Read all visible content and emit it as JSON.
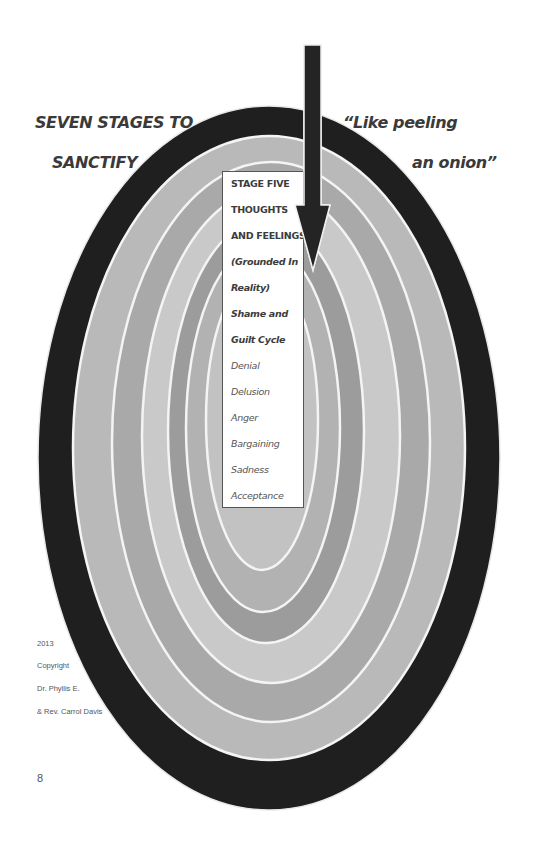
{
  "title": {
    "line1": "SEVEN STAGES TO",
    "line2": "SANCTIFY"
  },
  "quote": {
    "line1": "“Like peeling",
    "line2": "an onion”"
  },
  "stage_box": {
    "lines": [
      {
        "text": "STAGE FIVE",
        "style": "bold"
      },
      {
        "text": "THOUGHTS",
        "style": "bold"
      },
      {
        "text": "AND FEELINGS",
        "style": "bold"
      },
      {
        "text": "(Grounded In",
        "style": "bold-italic"
      },
      {
        "text": "Reality)",
        "style": "bold-italic"
      },
      {
        "text": "Shame and",
        "style": "bold-italic"
      },
      {
        "text": "Guilt Cycle",
        "style": "bold-italic"
      },
      {
        "text": "Denial",
        "style": "italic"
      },
      {
        "text": "Delusion",
        "style": "italic"
      },
      {
        "text": "Anger",
        "style": "italic"
      },
      {
        "text": "Bargaining",
        "style": "italic"
      },
      {
        "text": "Sadness",
        "style": "italic"
      },
      {
        "text": "Acceptance",
        "style": "italic"
      }
    ]
  },
  "copyright": {
    "year": "2013",
    "label": "Copyright",
    "author1": "Dr. Phyllis E.",
    "author2": "& Rev. Carrol Davis"
  },
  "page_number": "8",
  "diagram": {
    "type": "concentric-onion-rings",
    "ring_count": 7,
    "ring_colors": [
      "#1f1f1f",
      "#b9b9b9",
      "#a9a9a9",
      "#c9c9c9",
      "#9c9c9c",
      "#b2b2b2",
      "#c2c2c2"
    ],
    "separator_color": "#f4f4f4",
    "arrow_color": "#242424"
  }
}
